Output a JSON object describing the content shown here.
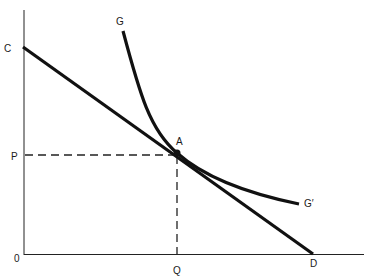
{
  "diagram": {
    "type": "economics-tangency",
    "axes": {
      "origin_label": "0",
      "y_axis_label_top": "C",
      "y_axis_label_price": "P",
      "x_axis_label_quantity": "Q",
      "x_axis_label_end": "D"
    },
    "curves": {
      "budget_line": {
        "from_label": "C",
        "to_label": "D"
      },
      "indifference_curve": {
        "start_label": "G",
        "end_label": "G′"
      }
    },
    "tangency_point": {
      "label": "A"
    },
    "colors": {
      "line": "#111111",
      "background": "#ffffff"
    }
  }
}
